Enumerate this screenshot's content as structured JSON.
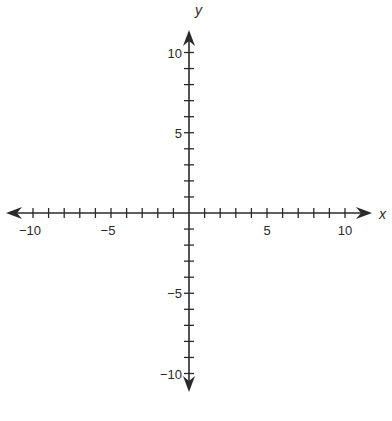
{
  "chart_data": {
    "type": "scatter",
    "title": "",
    "xlabel": "x",
    "ylabel": "y",
    "xlim": [
      -11,
      11
    ],
    "ylim": [
      -11,
      11
    ],
    "grid": false,
    "x_ticks": [
      -10,
      -9,
      -8,
      -7,
      -6,
      -5,
      -4,
      -3,
      -2,
      -1,
      1,
      2,
      3,
      4,
      5,
      6,
      7,
      8,
      9,
      10
    ],
    "y_ticks": [
      -10,
      -9,
      -8,
      -7,
      -6,
      -5,
      -4,
      -3,
      -2,
      -1,
      1,
      2,
      3,
      4,
      5,
      6,
      7,
      8,
      9,
      10
    ],
    "x_tick_labels": [
      {
        "value": -10,
        "label": "−10"
      },
      {
        "value": -5,
        "label": "−5"
      },
      {
        "value": 5,
        "label": "5"
      },
      {
        "value": 10,
        "label": "10"
      }
    ],
    "y_tick_labels": [
      {
        "value": 10,
        "label": "10"
      },
      {
        "value": 5,
        "label": "5"
      },
      {
        "value": -5,
        "label": "−5"
      },
      {
        "value": -10,
        "label": "−10"
      }
    ],
    "series": [],
    "axis_arrows": true,
    "colors": {
      "axis": "#2a2a2a",
      "background": "#ffffff"
    }
  },
  "layout": {
    "origin_x": 189,
    "origin_y": 213,
    "x_unit_px": 15.6,
    "y_unit_px": 16.05,
    "x_axis_left": 6,
    "x_axis_right": 372,
    "y_axis_top": 30,
    "y_axis_bottom": 392
  }
}
